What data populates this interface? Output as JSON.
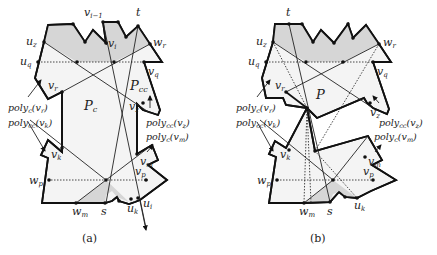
{
  "figure": {
    "panels": [
      {
        "caption": "(a)",
        "region_labels": {
          "Pc": "P",
          "Pc_sub": "c",
          "Pcc": "P",
          "Pcc_sub": "cc"
        },
        "vertex_labels": {
          "v_i_minus_1": "v",
          "v_i_minus_1_sub": "i−1",
          "t": "t",
          "u_z": "u",
          "u_z_sub": "z",
          "v_i": "v",
          "v_i_sub": "i",
          "w_r": "w",
          "w_r_sub": "r",
          "u_q": "u",
          "u_q_sub": "q",
          "v_q": "v",
          "v_q_sub": "q",
          "v_r": "v",
          "v_r_sub": "r",
          "v_z": "v",
          "v_z_sub": "z",
          "v_k": "v",
          "v_k_sub": "k",
          "v_m": "v",
          "v_m_sub": "m",
          "v_p": "v",
          "v_p_sub": "p",
          "w_p": "w",
          "w_p_sub": "p",
          "w_m": "w",
          "w_m_sub": "m",
          "s": "s",
          "u_k": "u",
          "u_k_sub": "k",
          "u_i": "u",
          "u_i_sub": "i"
        },
        "annotations": {
          "poly_c_vr": "poly",
          "poly_c_vr_sub": "c",
          "poly_c_vr_arg": "(v",
          "poly_c_vr_argsub": "r",
          "poly_c_vr_close": ")",
          "poly_cc_vk": "poly",
          "poly_cc_vk_sub": "cc",
          "poly_cc_vk_arg": "(v",
          "poly_cc_vk_argsub": "k",
          "poly_cc_vk_close": ")",
          "poly_cc_vz": "poly",
          "poly_cc_vz_sub": "cc",
          "poly_cc_vz_arg": "(v",
          "poly_cc_vz_argsub": "z",
          "poly_cc_vz_close": ")",
          "poly_c_vm": "poly",
          "poly_c_vm_sub": "c",
          "poly_c_vm_arg": "(v",
          "poly_c_vm_argsub": "m",
          "poly_c_vm_close": ")"
        }
      },
      {
        "caption": "(b)",
        "region_labels": {
          "P": "P"
        },
        "vertex_labels": {
          "t": "t",
          "u_z": "u",
          "u_z_sub": "z",
          "w_r": "w",
          "w_r_sub": "r",
          "u_q": "u",
          "u_q_sub": "q",
          "v_q": "v",
          "v_q_sub": "q",
          "v_r": "v",
          "v_r_sub": "r",
          "v_z": "v",
          "v_z_sub": "z",
          "v_k": "v",
          "v_k_sub": "k",
          "v_m": "v",
          "v_m_sub": "m",
          "v_p": "v",
          "v_p_sub": "p",
          "w_p": "w",
          "w_p_sub": "p",
          "w_m": "w",
          "w_m_sub": "m",
          "s": "s",
          "u_k": "u",
          "u_k_sub": "k"
        },
        "annotations": {
          "poly_c_vr": "poly",
          "poly_c_vr_sub": "c",
          "poly_c_vr_arg": "(v",
          "poly_c_vr_argsub": "r",
          "poly_c_vr_close": ")",
          "poly_cc_vk": "poly",
          "poly_cc_vk_sub": "cc",
          "poly_cc_vk_arg": "(v",
          "poly_cc_vk_argsub": "k",
          "poly_cc_vk_close": ")",
          "poly_cc_vz": "poly",
          "poly_cc_vz_sub": "cc",
          "poly_cc_vz_arg": "(v",
          "poly_cc_vz_argsub": "z",
          "poly_cc_vz_close": ")",
          "poly_c_vm": "poly",
          "poly_c_vm_sub": "c",
          "poly_c_vm_arg": "(v",
          "poly_c_vm_argsub": "m",
          "poly_c_vm_close": ")"
        }
      }
    ]
  }
}
